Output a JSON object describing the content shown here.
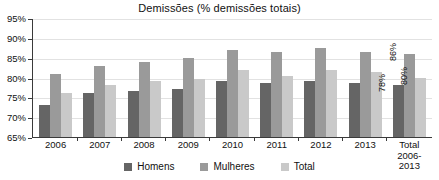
{
  "chart_data": {
    "type": "bar",
    "title": "Demissões (% demissões totais)",
    "xlabel": "",
    "ylabel": "",
    "ylim": [
      65,
      95
    ],
    "ytick_labels": [
      "95%",
      "90%",
      "85%",
      "80%",
      "75%",
      "70%",
      "65%"
    ],
    "yticks": [
      95,
      90,
      85,
      80,
      75,
      70,
      65
    ],
    "grid": true,
    "legend_position": "bottom",
    "categories": [
      "2006",
      "2007",
      "2008",
      "2009",
      "2010",
      "2011",
      "2012",
      "2013",
      "Total 2006-2013"
    ],
    "category_lines": [
      {
        "l1": "2006",
        "l2": ""
      },
      {
        "l1": "2007",
        "l2": ""
      },
      {
        "l1": "2008",
        "l2": ""
      },
      {
        "l1": "2009",
        "l2": ""
      },
      {
        "l1": "2010",
        "l2": ""
      },
      {
        "l1": "2011",
        "l2": ""
      },
      {
        "l1": "2012",
        "l2": ""
      },
      {
        "l1": "2013",
        "l2": ""
      },
      {
        "l1": "Total",
        "l2": "2006-2013"
      }
    ],
    "series": [
      {
        "name": "Homens",
        "color": "#656565",
        "values": [
          73,
          76,
          76.5,
          77,
          79,
          78.5,
          79,
          78.5,
          78
        ]
      },
      {
        "name": "Mulheres",
        "color": "#9a9a9a",
        "values": [
          81,
          83,
          84,
          85,
          87,
          86.5,
          87.5,
          86.5,
          86
        ]
      },
      {
        "name": "Total",
        "color": "#c9c9c9",
        "values": [
          76,
          78,
          79,
          79.5,
          82,
          80.5,
          82,
          81.5,
          80
        ]
      }
    ],
    "data_labels": [
      {
        "category": "Total 2006-2013",
        "series": "Homens",
        "text": "78%"
      },
      {
        "category": "Total 2006-2013",
        "series": "Mulheres",
        "text": "86%"
      },
      {
        "category": "Total 2006-2013",
        "series": "Total",
        "text": "80%"
      }
    ]
  }
}
